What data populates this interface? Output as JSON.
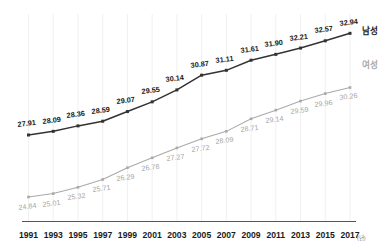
{
  "chart_data": {
    "type": "line",
    "title": "",
    "xlabel": "",
    "ylabel": "",
    "x_unit": "(년)",
    "grid": "vertical",
    "legend_position": "right-inline",
    "categories": [
      "1991",
      "1993",
      "1995",
      "1997",
      "1999",
      "2001",
      "2003",
      "2005",
      "2007",
      "2009",
      "2011",
      "2013",
      "2015",
      "2017"
    ],
    "xlim": [
      1991,
      2017
    ],
    "ylim": [
      24.0,
      33.6
    ],
    "series": [
      {
        "name": "남성",
        "color": "#333333",
        "marker": "square",
        "label_color": "#1b1b1b",
        "values": [
          27.91,
          28.09,
          28.36,
          28.59,
          29.07,
          29.55,
          30.14,
          30.87,
          31.11,
          31.61,
          31.9,
          32.21,
          32.57,
          32.94
        ],
        "labels": [
          "27.91",
          "28.09",
          "28.36",
          "28.59",
          "29.07",
          "29.55",
          "30.14",
          "30.87",
          "31.11",
          "31.61",
          "31.90",
          "32.21",
          "32.57",
          "32.94"
        ]
      },
      {
        "name": "여성",
        "color": "#a9a9a9",
        "marker": "square",
        "label_color": "#a6a6a6",
        "values": [
          24.84,
          25.01,
          25.32,
          25.71,
          26.29,
          26.78,
          27.27,
          27.72,
          28.09,
          28.71,
          29.14,
          29.59,
          29.96,
          30.26
        ],
        "labels": [
          "24.84",
          "25.01",
          "25.32",
          "25.71",
          "26.29",
          "26.78",
          "27.27",
          "27.72",
          "28.09",
          "28.71",
          "29.14",
          "29.59",
          "29.96",
          "30.26"
        ]
      }
    ]
  },
  "legend": {
    "male": "남성",
    "female": "여성"
  },
  "axis": {
    "unit": "(년)",
    "baseline_color": "#555555",
    "gridline_color": "#f0f0f0"
  }
}
